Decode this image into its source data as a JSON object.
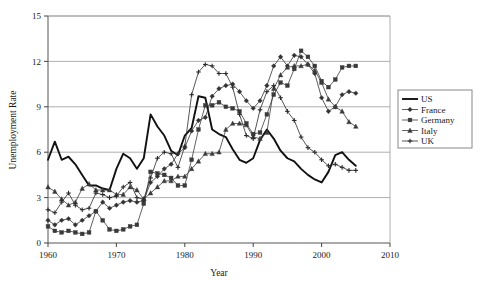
{
  "chart_data": {
    "type": "line",
    "title": "",
    "xlabel": "Year",
    "ylabel": "Unemployment Rate",
    "xlim": [
      1960,
      2010
    ],
    "ylim": [
      0,
      15
    ],
    "xticks": [
      1960,
      1970,
      1980,
      1990,
      2000,
      2010
    ],
    "yticks": [
      0,
      3,
      6,
      9,
      12,
      15
    ],
    "grid": "horizontal",
    "legend_position": "right-outside",
    "x": [
      1960,
      1961,
      1962,
      1963,
      1964,
      1965,
      1966,
      1967,
      1968,
      1969,
      1970,
      1971,
      1972,
      1973,
      1974,
      1975,
      1976,
      1977,
      1978,
      1979,
      1980,
      1981,
      1982,
      1983,
      1984,
      1985,
      1986,
      1987,
      1988,
      1989,
      1990,
      1991,
      1992,
      1993,
      1994,
      1995,
      1996,
      1997,
      1998,
      1999,
      2000,
      2001,
      2002,
      2003,
      2004,
      2005
    ],
    "series": [
      {
        "name": "US",
        "marker": "none",
        "line_width": 1.9,
        "color": "#111111",
        "values": [
          5.5,
          6.7,
          5.5,
          5.7,
          5.2,
          4.5,
          3.8,
          3.8,
          3.6,
          3.5,
          4.9,
          5.9,
          5.6,
          4.9,
          5.6,
          8.5,
          7.7,
          7.1,
          6.1,
          5.8,
          7.1,
          7.6,
          9.7,
          9.6,
          7.5,
          7.2,
          7.0,
          6.2,
          5.5,
          5.3,
          5.6,
          6.8,
          7.5,
          6.9,
          6.1,
          5.6,
          5.4,
          4.9,
          4.5,
          4.2,
          4.0,
          4.7,
          5.8,
          6.0,
          5.5,
          5.1
        ]
      },
      {
        "name": "France",
        "marker": "diamond",
        "line_width": 0.8,
        "color": "#333333",
        "values": [
          1.5,
          1.2,
          1.5,
          1.6,
          1.2,
          1.5,
          1.8,
          2.1,
          2.7,
          2.3,
          2.5,
          2.7,
          2.8,
          2.7,
          2.8,
          4.0,
          4.4,
          4.9,
          5.2,
          5.9,
          6.3,
          7.4,
          8.1,
          8.3,
          9.7,
          10.2,
          10.4,
          10.5,
          10.0,
          9.4,
          8.9,
          9.4,
          10.4,
          11.7,
          12.3,
          11.7,
          12.4,
          12.3,
          11.8,
          11.2,
          9.6,
          8.7,
          9.0,
          9.8,
          10.0,
          9.9
        ]
      },
      {
        "name": "Germany",
        "marker": "square",
        "line_width": 0.8,
        "color": "#3a3a3a",
        "values": [
          1.1,
          0.8,
          0.7,
          0.8,
          0.7,
          0.6,
          0.7,
          2.1,
          1.5,
          0.9,
          0.8,
          0.9,
          1.1,
          1.2,
          2.6,
          4.7,
          4.6,
          4.5,
          4.3,
          3.8,
          3.8,
          5.5,
          7.5,
          9.1,
          9.1,
          9.3,
          9.0,
          8.9,
          8.7,
          7.9,
          7.2,
          7.3,
          8.5,
          9.8,
          10.6,
          10.4,
          11.5,
          12.7,
          12.3,
          11.7,
          10.7,
          10.3,
          10.8,
          11.6,
          11.7,
          11.7
        ]
      },
      {
        "name": "Italy",
        "marker": "triangle",
        "line_width": 0.8,
        "color": "#3a3a3a",
        "values": [
          3.7,
          3.4,
          2.9,
          2.5,
          2.7,
          3.6,
          3.9,
          3.5,
          3.5,
          3.5,
          3.2,
          3.2,
          3.7,
          3.5,
          2.9,
          3.3,
          3.7,
          4.1,
          4.1,
          4.4,
          4.4,
          4.9,
          5.4,
          5.9,
          5.9,
          6.0,
          7.5,
          7.9,
          7.9,
          7.8,
          7.0,
          6.9,
          7.3,
          10.2,
          11.1,
          11.6,
          11.7,
          11.7,
          11.8,
          11.4,
          10.6,
          9.5,
          9.0,
          8.7,
          8.0,
          7.7
        ]
      },
      {
        "name": "UK",
        "marker": "plus",
        "line_width": 0.8,
        "color": "#2b2b2b",
        "values": [
          2.2,
          2.0,
          2.7,
          3.3,
          2.5,
          2.2,
          2.3,
          3.3,
          3.2,
          3.0,
          3.1,
          3.7,
          4.0,
          3.0,
          2.9,
          4.3,
          5.6,
          6.0,
          5.9,
          5.0,
          6.4,
          9.8,
          11.3,
          11.8,
          11.7,
          11.2,
          11.2,
          10.3,
          8.5,
          7.1,
          6.9,
          8.8,
          10.0,
          10.4,
          9.6,
          8.7,
          8.1,
          7.0,
          6.3,
          6.0,
          5.5,
          5.1,
          5.2,
          5.0,
          4.8,
          4.8
        ]
      }
    ]
  },
  "legend": {
    "items": [
      {
        "label": "US"
      },
      {
        "label": "France"
      },
      {
        "label": "Germany"
      },
      {
        "label": "Italy"
      },
      {
        "label": "UK"
      }
    ]
  },
  "axes": {
    "x_title": "Year",
    "y_title": "Unemployment Rate"
  }
}
